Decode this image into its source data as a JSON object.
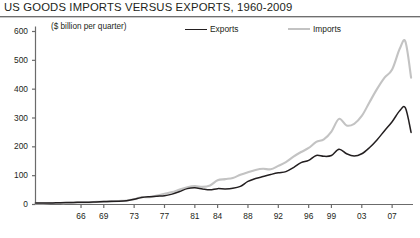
{
  "header": {
    "title": "US GOODS IMPORTS VERSUS EXPORTS, 1960-2009"
  },
  "chart_data": {
    "type": "line",
    "title": "US GOODS IMPORTS VERSUS EXPORTS, 1960-2009",
    "subtitle": "($ billion per quarter)",
    "xlabel": "",
    "ylabel": "",
    "ylim": [
      0,
      600
    ],
    "yticks": [
      0,
      100,
      200,
      300,
      400,
      500,
      600
    ],
    "ytick_labels": [
      "0",
      "100",
      "200",
      "300",
      "400",
      "500",
      "600"
    ],
    "xlim": [
      1960,
      2009.75
    ],
    "xticks": [
      1966,
      1969,
      1973,
      1977,
      1981,
      1984,
      1988,
      1992,
      1996,
      1999,
      2003,
      2007
    ],
    "xtick_labels": [
      "66",
      "69",
      "73",
      "77",
      "81",
      "84",
      "88",
      "92",
      "96",
      "99",
      "03",
      "07"
    ],
    "grid": false,
    "legend_position": "top",
    "colors": {
      "exports": "#231f20",
      "imports": "#c3c3c3",
      "axis": "#6b6b6b",
      "rule": "#6f6f6f"
    },
    "series": [
      {
        "name": "Exports",
        "color": "#231f20",
        "x": [
          1960,
          1961,
          1962,
          1963,
          1964,
          1965,
          1966,
          1967,
          1968,
          1969,
          1970,
          1971,
          1972,
          1973,
          1974,
          1975,
          1976,
          1977,
          1978,
          1979,
          1980,
          1981,
          1982,
          1983,
          1984,
          1985,
          1986,
          1987,
          1988,
          1989,
          1990,
          1991,
          1992,
          1993,
          1994,
          1995,
          1996,
          1997,
          1998,
          1999,
          2000,
          2001,
          2002,
          2003,
          2004,
          2005,
          2006,
          2007,
          2008,
          2008.75,
          2009.5
        ],
        "values": [
          5,
          5,
          5,
          6,
          7,
          7,
          8,
          8,
          9,
          10,
          11,
          11,
          13,
          18,
          24,
          27,
          29,
          30,
          36,
          45,
          55,
          58,
          54,
          51,
          55,
          54,
          56,
          63,
          80,
          90,
          97,
          104,
          110,
          114,
          128,
          145,
          153,
          170,
          167,
          170,
          192,
          176,
          168,
          176,
          197,
          224,
          256,
          287,
          325,
          335,
          250
        ]
      },
      {
        "name": "Imports",
        "color": "#c3c3c3",
        "x": [
          1960,
          1961,
          1962,
          1963,
          1964,
          1965,
          1966,
          1967,
          1968,
          1969,
          1970,
          1971,
          1972,
          1973,
          1974,
          1975,
          1976,
          1977,
          1978,
          1979,
          1980,
          1981,
          1982,
          1983,
          1984,
          1985,
          1986,
          1987,
          1988,
          1989,
          1990,
          1991,
          1992,
          1993,
          1994,
          1995,
          1996,
          1997,
          1998,
          1999,
          2000,
          2001,
          2002,
          2003,
          2004,
          2005,
          2006,
          2007,
          2008,
          2008.75,
          2009.5
        ],
        "values": [
          4,
          4,
          5,
          5,
          5,
          6,
          7,
          7,
          9,
          9,
          10,
          12,
          14,
          18,
          26,
          25,
          31,
          37,
          43,
          52,
          60,
          64,
          61,
          66,
          84,
          88,
          92,
          103,
          112,
          120,
          124,
          122,
          134,
          147,
          166,
          182,
          196,
          217,
          226,
          253,
          297,
          274,
          280,
          307,
          354,
          400,
          440,
          468,
          540,
          565,
          440
        ]
      }
    ],
    "annotations": []
  },
  "legend": {
    "items": [
      {
        "label": "Exports",
        "swatch": "black-line-swatch"
      },
      {
        "label": "Imports",
        "swatch": "gray-line-swatch"
      }
    ]
  }
}
